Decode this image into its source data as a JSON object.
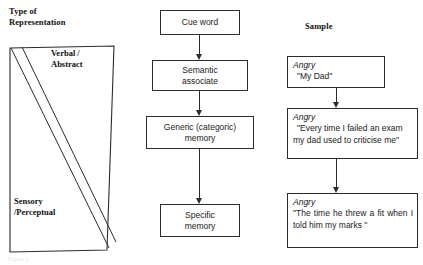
{
  "figure": {
    "headings": {
      "type_of_representation": "Type of\nRepresentation",
      "sample": "Sample"
    },
    "representation_shape": {
      "name": "representation-gradient-quadrilateral",
      "top_label": "Verbal /\nAbstract",
      "bottom_label": "Sensory\n/Perceptual",
      "stroke_color": "#2b2b2b"
    },
    "process_chain": [
      {
        "id": "cue-word",
        "label": "Cue word"
      },
      {
        "id": "semantic-associate",
        "label": "Semantic\nassociate"
      },
      {
        "id": "generic-categoric-memory",
        "label": "Generic (categoric)\nmemory"
      },
      {
        "id": "specific-memory",
        "label": "Specific\nmemory"
      }
    ],
    "samples": [
      {
        "id": "sample-semantic",
        "emotion": "Angry",
        "quote": "\"My Dad\""
      },
      {
        "id": "sample-generic",
        "emotion": "Angry",
        "quote": "\"Every time I failed an exam my dad used to criticise me\""
      },
      {
        "id": "sample-specific",
        "emotion": "Angry",
        "quote": "\"The time he threw a fit when I told him my marks \""
      }
    ],
    "caption_remnant": "Figure 1.",
    "colors": {
      "ink": "#1a1a1a",
      "stroke": "#2b2b2b",
      "background": "#ffffff"
    }
  }
}
